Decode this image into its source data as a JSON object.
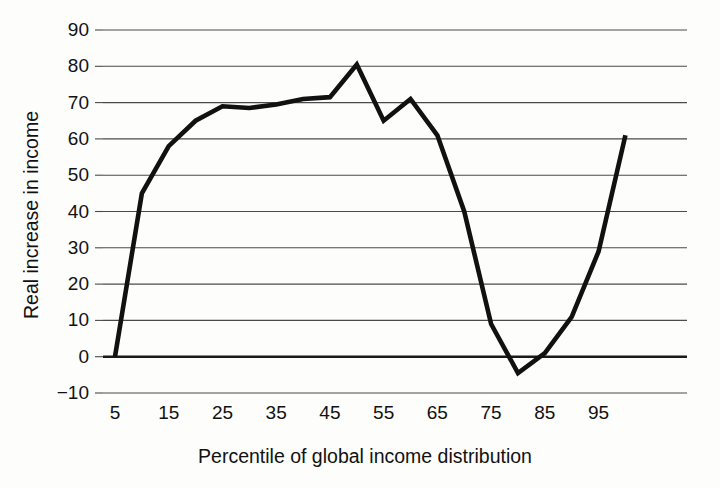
{
  "chart_data": {
    "type": "line",
    "title": "",
    "xlabel": "Percentile of global income distribution",
    "ylabel": "Real increase in income",
    "xlim": [
      5,
      100
    ],
    "ylim": [
      -10,
      90
    ],
    "x_ticks": [
      5,
      15,
      25,
      35,
      45,
      55,
      65,
      75,
      85,
      95
    ],
    "x_tick_labels": [
      "5",
      "15",
      "25",
      "35",
      "45",
      "55",
      "65",
      "75",
      "85",
      "95"
    ],
    "y_ticks": [
      -10,
      0,
      10,
      20,
      30,
      40,
      50,
      60,
      70,
      80,
      90
    ],
    "y_tick_labels": [
      "−10",
      "0",
      "10",
      "20",
      "30",
      "40",
      "50",
      "60",
      "70",
      "80",
      "90"
    ],
    "grid": true,
    "grid_axis": "y",
    "legend": "none",
    "line_color": "#111111",
    "grid_color": "#4a4a4a",
    "zero_line_color": "#1a1a1a",
    "background_color": "#fdfdfc",
    "x": [
      5,
      10,
      15,
      20,
      25,
      30,
      35,
      40,
      45,
      50,
      55,
      60,
      65,
      70,
      75,
      80,
      85,
      90,
      95,
      100
    ],
    "values": [
      0,
      45,
      58,
      65,
      69,
      68.5,
      69.5,
      71,
      71.5,
      80.5,
      65,
      71,
      61,
      40,
      9,
      -4.5,
      1,
      11,
      29,
      61
    ],
    "series": [
      {
        "name": "Real increase in income",
        "values": [
          0,
          45,
          58,
          65,
          69,
          68.5,
          69.5,
          71,
          71.5,
          80.5,
          65,
          71,
          61,
          40,
          9,
          -4.5,
          1,
          11,
          29,
          61
        ]
      }
    ],
    "annotations": []
  }
}
